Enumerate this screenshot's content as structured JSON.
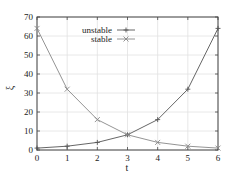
{
  "chart_data": {
    "type": "line",
    "title": "",
    "xlabel": "t",
    "ylabel": "ξ",
    "xlim": [
      0,
      6
    ],
    "ylim": [
      0,
      70
    ],
    "x": [
      0,
      1,
      2,
      3,
      4,
      5,
      6
    ],
    "xticks": [
      0,
      1,
      2,
      3,
      4,
      5,
      6
    ],
    "yticks": [
      0,
      10,
      20,
      30,
      40,
      50,
      60,
      70
    ],
    "grid": true,
    "legend_position": "upper center",
    "series": [
      {
        "name": "unstable",
        "marker": "+",
        "color": "#555555",
        "values": [
          1,
          2,
          4,
          8,
          16,
          32,
          64
        ]
      },
      {
        "name": "stable",
        "marker": "x",
        "color": "#888888",
        "values": [
          64,
          32,
          16,
          8,
          4,
          2,
          1
        ]
      }
    ]
  }
}
